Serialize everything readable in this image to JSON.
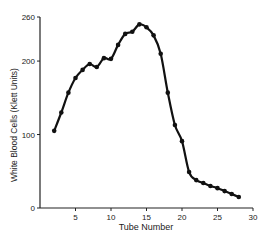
{
  "chart_data": {
    "type": "line",
    "title": "",
    "xlabel": "Tube Number",
    "ylabel": "White Blood Cells (Klett Units)",
    "xlim": [
      0,
      30
    ],
    "ylim": [
      0,
      260
    ],
    "xticks": [
      5,
      10,
      15,
      20,
      25,
      30
    ],
    "yticks": [
      0,
      100,
      200,
      260
    ],
    "grid": false,
    "legend": null,
    "series": [
      {
        "name": "White Blood Cells",
        "x": [
          2,
          3,
          4,
          5,
          6,
          7,
          8,
          9,
          10,
          11,
          12,
          13,
          14,
          15,
          16,
          17,
          18,
          19,
          20,
          21,
          22,
          23,
          24,
          25,
          26,
          27,
          28
        ],
        "values": [
          105,
          130,
          157,
          177,
          188,
          196,
          192,
          204,
          203,
          222,
          237,
          240,
          250,
          246,
          235,
          210,
          157,
          113,
          91,
          49,
          38,
          34,
          30,
          27,
          23,
          19,
          15
        ]
      }
    ]
  }
}
